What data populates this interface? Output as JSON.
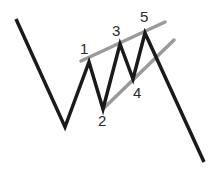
{
  "diagram": {
    "wave_labels": [
      "1",
      "2",
      "3",
      "4",
      "5"
    ],
    "colors": {
      "price_line": "#1a1a1a",
      "trend_lines": "#9a9a9a",
      "background": "#ffffff"
    },
    "elements": {
      "price_path": "zigzag price path with five waves",
      "upper_trendline": "line connecting wave 1, 3, 5 tops",
      "lower_trendline": "line connecting wave 2, 4 bottoms"
    }
  }
}
